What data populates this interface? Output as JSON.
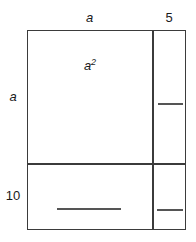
{
  "figure": {
    "stroke_color": "#3b3b3b",
    "line_color": "#555555",
    "background_color": "#ffffff",
    "text_color": "#1a1a1a"
  },
  "dimensions": {
    "top": [
      {
        "label": "a",
        "italic": true,
        "segment": "left-column-width"
      },
      {
        "label": "5",
        "italic": false,
        "segment": "right-column-width"
      }
    ],
    "left": [
      {
        "label": "a",
        "italic": true,
        "segment": "top-row-height"
      },
      {
        "label": "10",
        "italic": false,
        "segment": "bottom-row-height"
      }
    ]
  },
  "cells": {
    "top_left": {
      "name": "a-squared-region",
      "label": "a",
      "exponent": "2",
      "filled": true
    },
    "top_right": {
      "name": "top-right-region",
      "label": "",
      "filled": false
    },
    "bottom_left": {
      "name": "bottom-left-region",
      "label": "",
      "filled": false
    },
    "bottom_right": {
      "name": "bottom-right-region",
      "label": "",
      "filled": false
    }
  },
  "answer_lines": {
    "top_right": "",
    "bottom_left": "",
    "bottom_right": ""
  },
  "chart_data": {
    "type": "table",
    "column_headers": [
      "a",
      "5"
    ],
    "row_headers": [
      "a",
      "10"
    ],
    "cells": [
      [
        "a2",
        ""
      ],
      [
        "",
        ""
      ]
    ]
  }
}
